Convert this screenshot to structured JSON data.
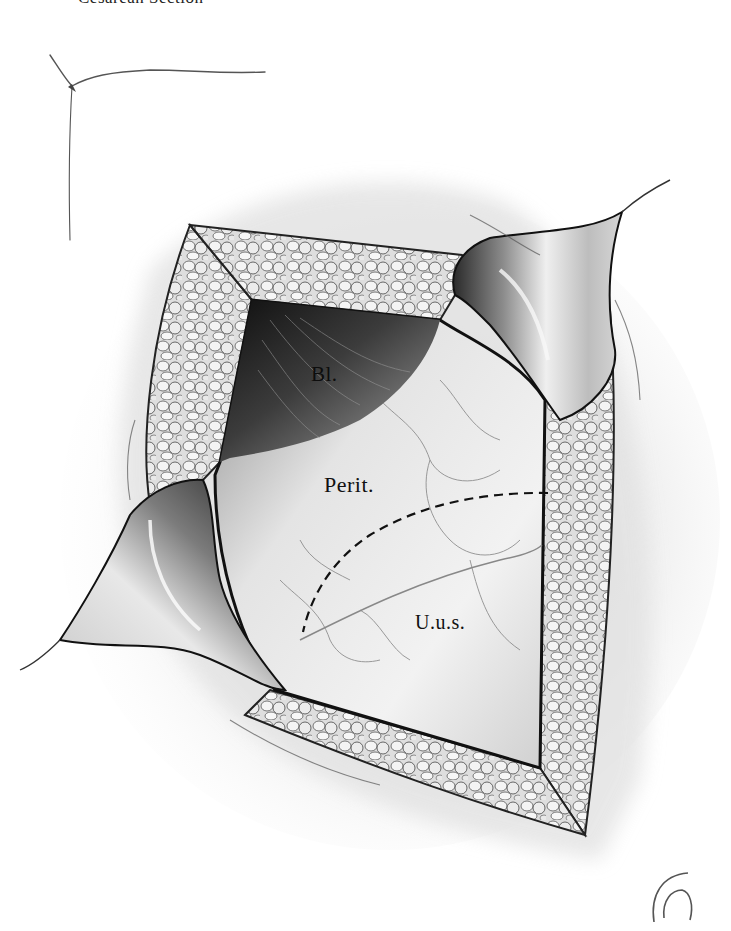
{
  "page": {
    "title": "Cesarean Section"
  },
  "illustration": {
    "subject": "Lower uterine segment exposure through abdominal incision with retractors",
    "labels": {
      "bladder": "Bl.",
      "peritoneum": "Perit.",
      "lower_uterine_segment": "U.u.s."
    },
    "incision_line_style": "dashed",
    "colors": {
      "background": "#ffffff",
      "skin_shadow": "#d8d8d8",
      "fat_pad": "#dcdcdc",
      "fat_outline": "#3a3a3a",
      "retractor": "#c8c8c8",
      "bladder_dark": "#1a1a1a",
      "peritoneum": "#eeeeee",
      "ink": "#111111"
    }
  }
}
